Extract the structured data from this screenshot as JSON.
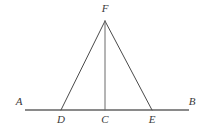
{
  "figure": {
    "canvas": {
      "width": 207,
      "height": 131,
      "background": "#ffffff"
    },
    "style": {
      "baseline_color": "#8a8a8a",
      "baseline_width": 2,
      "segment_color": "#4a4a4a",
      "segment_width": 1,
      "label_color": "#3a3a3a",
      "label_font_size": 11
    },
    "points": [
      {
        "id": "A",
        "label": "A",
        "x": 25,
        "y": 110,
        "label_x": 19,
        "label_y": 96,
        "role": "ray-end-left"
      },
      {
        "id": "D",
        "label": "D",
        "x": 61,
        "y": 110,
        "label_x": 61,
        "label_y": 114,
        "role": "triangle-base-left"
      },
      {
        "id": "C",
        "label": "C",
        "x": 105,
        "y": 110,
        "label_x": 105,
        "label_y": 114,
        "role": "foot-of-altitude"
      },
      {
        "id": "E",
        "label": "E",
        "x": 152,
        "y": 110,
        "label_x": 152,
        "label_y": 114,
        "role": "triangle-base-right"
      },
      {
        "id": "B",
        "label": "B",
        "x": 189,
        "y": 110,
        "label_x": 192,
        "label_y": 96,
        "role": "ray-end-right"
      },
      {
        "id": "F",
        "label": "F",
        "x": 105,
        "y": 21,
        "label_x": 105,
        "label_y": 3,
        "role": "apex"
      }
    ],
    "segments": [
      {
        "id": "AB",
        "from": "A",
        "to": "B",
        "kind": "baseline"
      },
      {
        "id": "DF",
        "from": "D",
        "to": "F",
        "kind": "triangle-side"
      },
      {
        "id": "FE",
        "from": "F",
        "to": "E",
        "kind": "triangle-side"
      },
      {
        "id": "FC",
        "from": "F",
        "to": "C",
        "kind": "altitude"
      }
    ]
  }
}
